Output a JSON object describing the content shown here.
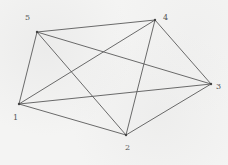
{
  "diagram": {
    "type": "complete-graph",
    "name": "K5",
    "colors": {
      "background": "#f4f4f3",
      "edge": "#5a5a5a",
      "label": "#555555"
    },
    "vertices": [
      {
        "id": "1",
        "label": "1",
        "x": 19,
        "y": 104,
        "lx": 13,
        "ly": 120
      },
      {
        "id": "2",
        "label": "2",
        "x": 126,
        "y": 135,
        "lx": 125,
        "ly": 150
      },
      {
        "id": "3",
        "label": "3",
        "x": 211,
        "y": 84,
        "lx": 216,
        "ly": 89
      },
      {
        "id": "4",
        "label": "4",
        "x": 155,
        "y": 20,
        "lx": 163,
        "ly": 20
      },
      {
        "id": "5",
        "label": "5",
        "x": 37,
        "y": 32,
        "lx": 25,
        "ly": 20
      }
    ],
    "edges": [
      [
        "1",
        "2"
      ],
      [
        "1",
        "3"
      ],
      [
        "1",
        "4"
      ],
      [
        "1",
        "5"
      ],
      [
        "2",
        "3"
      ],
      [
        "2",
        "4"
      ],
      [
        "2",
        "5"
      ],
      [
        "3",
        "4"
      ],
      [
        "3",
        "5"
      ],
      [
        "4",
        "5"
      ]
    ]
  }
}
